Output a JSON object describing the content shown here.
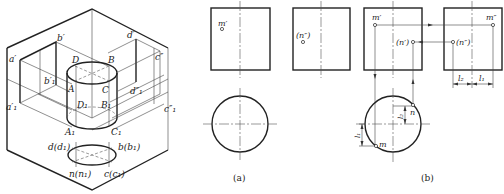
{
  "figure": {
    "type": "engineering projection diagram"
  },
  "isometric_view": {
    "labels": {
      "a_prime": "a′",
      "b_prime": "b′",
      "d_prime": "d′",
      "c_dprime": "c″",
      "b1_prime": "b′₁",
      "a1_prime": "a′₁",
      "d1_dprime": "d″₁",
      "c1_dprime": "c″₁",
      "D": "D",
      "B": "B",
      "A": "A",
      "C": "C",
      "D1": "D₁",
      "B1": "B₁",
      "A1": "A₁",
      "C1": "C₁",
      "d_d1": "d(d₁)",
      "b_b1": "b(b₁)",
      "n_n1": "n(n₁)",
      "c_c1": "c(c₁)"
    }
  },
  "panel_a": {
    "caption": "(a)",
    "front_view": {
      "point_label": "m′"
    },
    "side_view": {
      "point_label": "(n″)"
    },
    "top_view": {
      "shape": "circle"
    }
  },
  "panel_b": {
    "caption": "(b)",
    "front_view": {
      "point_m": "m′",
      "point_n": "(n′)"
    },
    "side_view": {
      "point_m": "m″",
      "point_n": "(n″)"
    },
    "dimensions": {
      "l2": "l₂",
      "l1": "l₁"
    },
    "top_view": {
      "point_m": "m",
      "point_n": "n",
      "dim_l1": "l₁",
      "dim_l2": "l₂"
    }
  },
  "colors": {
    "line": "#222222",
    "background": "#ffffff"
  }
}
